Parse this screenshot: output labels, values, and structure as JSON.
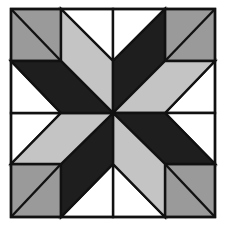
{
  "diagram": {
    "type": "quilt-block",
    "pattern": "eight-pointed star",
    "grid": {
      "rows": 4,
      "cols": 4
    },
    "colors": {
      "white": "#ffffff",
      "light_gray": "#c4c4c4",
      "mid_gray": "#9a9a9a",
      "dark": "#1e1e1e",
      "outline": "#111111"
    },
    "pieces": [
      {
        "name": "corner-top-left",
        "fill": "mid_gray",
        "points": "11,9 61,9 61,61 11,61"
      },
      {
        "name": "corner-top-right",
        "fill": "mid_gray",
        "points": "165,9 215,9 215,61 165,61"
      },
      {
        "name": "corner-bottom-left",
        "fill": "mid_gray",
        "points": "11,164 61,164 61,217 11,217"
      },
      {
        "name": "corner-bottom-right",
        "fill": "mid_gray",
        "points": "165,164 215,164 215,217 165,217"
      },
      {
        "name": "white-triangle-top-left",
        "fill": "white",
        "points": "61,9 113,9 113,61"
      },
      {
        "name": "white-triangle-top-right",
        "fill": "white",
        "points": "113,9 165,9 113,61"
      },
      {
        "name": "white-triangle-right-top",
        "fill": "white",
        "points": "215,61 215,113 165,113"
      },
      {
        "name": "white-triangle-right-bottom",
        "fill": "white",
        "points": "215,113 215,164 165,113"
      },
      {
        "name": "white-triangle-bottom-right",
        "fill": "white",
        "points": "165,217 113,217 113,164"
      },
      {
        "name": "white-triangle-bottom-left",
        "fill": "white",
        "points": "113,217 61,217 113,164"
      },
      {
        "name": "white-triangle-left-bottom",
        "fill": "white",
        "points": "11,164 11,113 61,113"
      },
      {
        "name": "white-triangle-left-top",
        "fill": "white",
        "points": "11,113 11,61 61,113"
      },
      {
        "name": "star-point-north-west-light",
        "fill": "light_gray",
        "points": "61,9 113,61 113,113 61,61"
      },
      {
        "name": "star-point-north-east-dark",
        "fill": "dark",
        "points": "165,9 165,61 113,113 113,61"
      },
      {
        "name": "star-point-east-north-light",
        "fill": "light_gray",
        "points": "215,61 165,113 113,113 165,61"
      },
      {
        "name": "star-point-east-south-dark",
        "fill": "dark",
        "points": "215,164 165,164 113,113 165,113"
      },
      {
        "name": "star-point-south-east-light",
        "fill": "light_gray",
        "points": "165,217 113,164 113,113 165,164"
      },
      {
        "name": "star-point-south-west-dark",
        "fill": "dark",
        "points": "61,217 61,164 113,113 113,164"
      },
      {
        "name": "star-point-west-south-light",
        "fill": "light_gray",
        "points": "11,164 61,113 113,113 61,164"
      },
      {
        "name": "star-point-west-north-dark",
        "fill": "dark",
        "points": "11,61 61,61 113,113 61,113"
      }
    ],
    "lines": [
      {
        "name": "corner-tl-diagonal",
        "x1": 11,
        "y1": 9,
        "x2": 61,
        "y2": 61
      },
      {
        "name": "corner-tr-diagonal",
        "x1": 215,
        "y1": 9,
        "x2": 165,
        "y2": 61
      },
      {
        "name": "corner-bl-diagonal",
        "x1": 61,
        "y1": 164,
        "x2": 11,
        "y2": 217
      },
      {
        "name": "corner-br-diagonal",
        "x1": 165,
        "y1": 164,
        "x2": 215,
        "y2": 217
      }
    ],
    "border": {
      "x": 11,
      "y": 9,
      "width": 204,
      "height": 208
    }
  }
}
